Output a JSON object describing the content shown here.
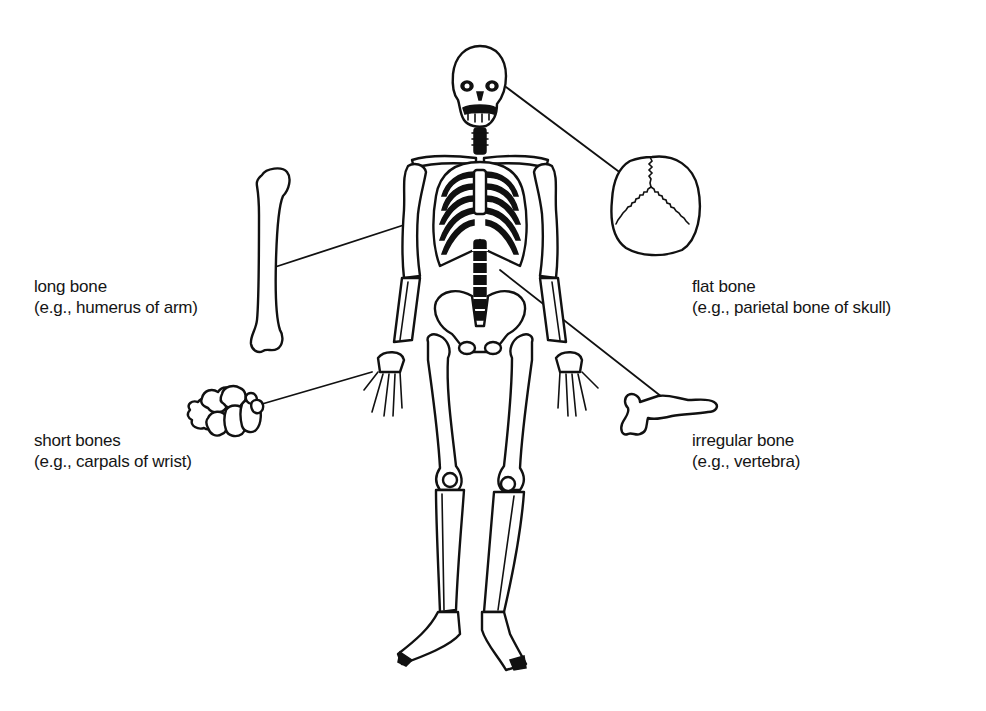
{
  "diagram": {
    "background": "#ffffff",
    "ink_color": "#111111",
    "labels": [
      {
        "id": "long-bone",
        "name": "long bone",
        "example": "(e.g., humerus of arm)",
        "x": 34,
        "y": 276
      },
      {
        "id": "flat-bone",
        "name": "flat bone",
        "example": "(e.g., parietal bone of skull)",
        "x": 692,
        "y": 276
      },
      {
        "id": "short-bones",
        "name": "short bones",
        "example": "(e.g., carpals of wrist)",
        "x": 34,
        "y": 430
      },
      {
        "id": "irregular-bone",
        "name": "irregular bone",
        "example": "(e.g.,  vertebra)",
        "x": 692,
        "y": 430
      }
    ],
    "connectors": [
      {
        "from": "humerus-illustration",
        "to": "skeleton-humerus",
        "x1": 272,
        "y1": 268,
        "x2": 410,
        "y2": 223
      },
      {
        "from": "skull-illustration",
        "to": "skeleton-skull",
        "x1": 630,
        "y1": 180,
        "x2": 506,
        "y2": 87
      },
      {
        "from": "carpals-illustration",
        "to": "skeleton-wrist",
        "x1": 262,
        "y1": 404,
        "x2": 372,
        "y2": 372
      },
      {
        "from": "vertebra-illustration",
        "to": "skeleton-spine",
        "x1": 662,
        "y1": 397,
        "x2": 500,
        "y2": 270
      }
    ]
  }
}
